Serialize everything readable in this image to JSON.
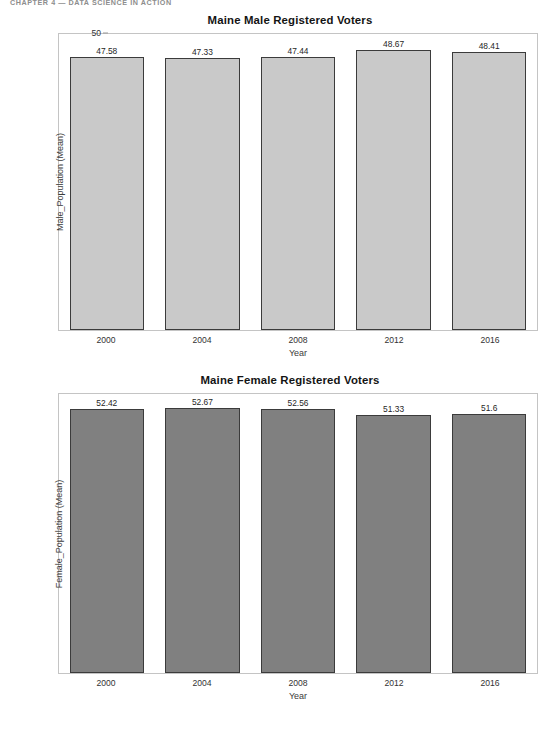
{
  "page": {
    "running_header": "CHAPTER 4   —   DATA SCIENCE IN ACTION"
  },
  "chart_data": [
    {
      "id": "male",
      "type": "bar",
      "title": "Maine Male Registered Voters",
      "xlabel": "Year",
      "ylabel": "Male_Population (Mean)",
      "categories": [
        "2000",
        "2004",
        "2008",
        "2012",
        "2016"
      ],
      "values": [
        47.58,
        47.33,
        47.44,
        48.67,
        48.41
      ],
      "value_labels": [
        "47.58",
        "47.33",
        "47.44",
        "48.67",
        "48.41"
      ],
      "ylim": [
        0,
        51.5
      ],
      "yticks": [
        0,
        10,
        20,
        30,
        40,
        50
      ],
      "ytick_labels": [
        "0",
        "10",
        "20",
        "30",
        "40",
        "50"
      ],
      "grid": false,
      "legend": "none",
      "bar_color": "#c9c9c9",
      "bar_edge_color": "#3b3b3b"
    },
    {
      "id": "female",
      "type": "bar",
      "title": "Maine Female Registered Voters",
      "xlabel": "Year",
      "ylabel": "Female_Population (Mean)",
      "categories": [
        "2000",
        "2004",
        "2008",
        "2012",
        "2016"
      ],
      "values": [
        52.42,
        52.67,
        52.56,
        51.33,
        51.6
      ],
      "value_labels": [
        "52.42",
        "52.67",
        "52.56",
        "51.33",
        "51.6"
      ],
      "ylim": [
        0,
        55.5
      ],
      "yticks": [
        10,
        20,
        30,
        40,
        50
      ],
      "ytick_labels": [
        "10",
        "20",
        "30",
        "40",
        "50"
      ],
      "zero_tick_label": "0",
      "grid": false,
      "legend": "none",
      "bar_color": "#808080",
      "bar_edge_color": "#3b3b3b"
    }
  ]
}
